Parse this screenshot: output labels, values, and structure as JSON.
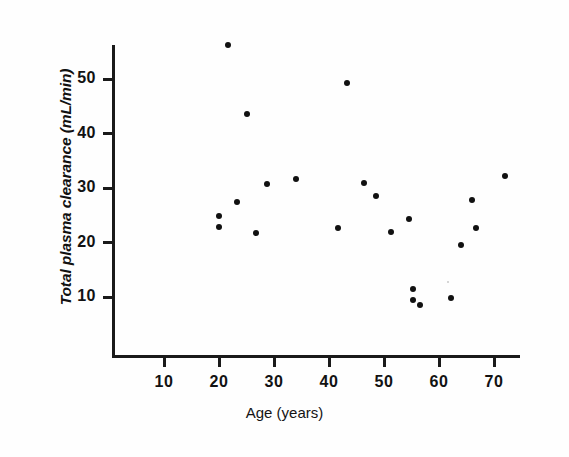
{
  "chart_data": {
    "type": "scatter",
    "title": "",
    "xlabel": "Age (years)",
    "ylabel": "Total plasma clearance (mL/min)",
    "xlim": [
      0,
      75
    ],
    "ylim": [
      0,
      60
    ],
    "xticks": [
      10,
      20,
      30,
      40,
      50,
      60,
      70
    ],
    "yticks": [
      10,
      20,
      30,
      40,
      50
    ],
    "xtick_labels": [
      "10",
      "20",
      "30",
      "40",
      "50",
      "60",
      "70"
    ],
    "ytick_labels": [
      "10",
      "20",
      "30",
      "40",
      "50"
    ],
    "grid": false,
    "legend": null,
    "marker": "filled-circle",
    "marker_color": "#111111",
    "series": [
      {
        "name": "subjects",
        "x": [
          21.6,
          25.1,
          43.3,
          28.7,
          34.0,
          23.3,
          20.0,
          20.0,
          26.7,
          41.6,
          46.4,
          48.5,
          54.5,
          51.3,
          66.0,
          66.7,
          64.0,
          72.0,
          55.3,
          55.3,
          56.5,
          62.2
        ],
        "y": [
          56.2,
          43.6,
          49.3,
          30.7,
          31.6,
          27.4,
          24.9,
          22.8,
          21.7,
          22.7,
          30.9,
          28.5,
          24.3,
          22.0,
          27.8,
          22.7,
          19.6,
          32.2,
          11.5,
          9.5,
          8.5,
          9.8
        ]
      }
    ],
    "n_points": 22
  },
  "axes": {
    "x_axis_name": "age-axis",
    "y_axis_name": "clearance-axis"
  }
}
